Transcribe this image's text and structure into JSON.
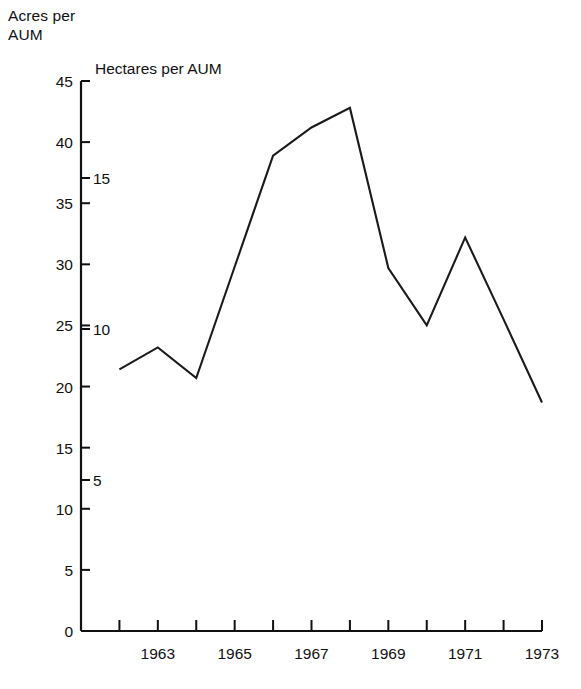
{
  "labels": {
    "acres_axis_title": "Acres per\nAUM",
    "hectares_axis_title": "Hectares per AUM"
  },
  "chart_data": {
    "type": "line",
    "title": "",
    "subtitle": "",
    "xlabel": "",
    "ylabel": "Acres per AUM",
    "y2label": "Hectares per AUM",
    "grid": false,
    "legend": "none",
    "xlim": [
      1962,
      1973
    ],
    "ylim": [
      0,
      45
    ],
    "y2lim": [
      0,
      18.2
    ],
    "x": [
      1962,
      1963,
      1964,
      1965,
      1966,
      1967,
      1968,
      1969,
      1970,
      1971,
      1972,
      1973
    ],
    "categories": [
      "1962",
      "1963",
      "1964",
      "1965",
      "1966",
      "1967",
      "1968",
      "1969",
      "1970",
      "1971",
      "1972",
      "1973"
    ],
    "values": [
      21.4,
      23.2,
      20.7,
      29.8,
      38.9,
      41.2,
      42.8,
      29.7,
      25.0,
      32.2,
      25.5,
      18.7
    ],
    "series": [
      {
        "name": "Acres per AUM",
        "values": [
          21.4,
          23.2,
          20.7,
          29.8,
          38.9,
          41.2,
          42.8,
          29.7,
          25.0,
          32.2,
          25.5,
          18.7
        ]
      }
    ],
    "xticks": [
      1962,
      1963,
      1964,
      1965,
      1966,
      1967,
      1968,
      1969,
      1970,
      1971,
      1972,
      1973
    ],
    "xticklabels": [
      "",
      "1963",
      "",
      "1965",
      "",
      "1967",
      "",
      "1969",
      "",
      "1971",
      "",
      "1973"
    ],
    "yticks": [
      0,
      5,
      10,
      15,
      20,
      25,
      30,
      35,
      40,
      45
    ],
    "yticklabels": [
      "0",
      "5",
      "10",
      "15",
      "20",
      "25",
      "30",
      "35",
      "40",
      "45"
    ],
    "y2ticks": [
      5,
      10,
      15
    ],
    "y2ticklabels": [
      "5",
      "10",
      "15"
    ],
    "line_color": "#1a1a1a",
    "axis_color": "#111111"
  }
}
